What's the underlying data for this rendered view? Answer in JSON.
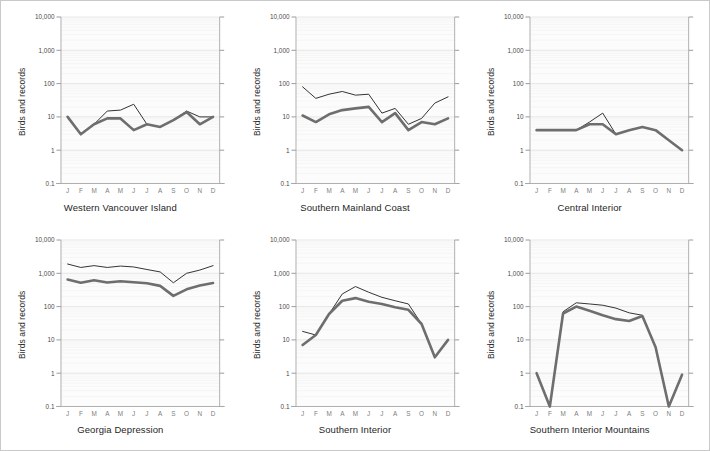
{
  "figure": {
    "axis_label_y": "Birds and records",
    "months": [
      "J",
      "F",
      "M",
      "A",
      "M",
      "J",
      "J",
      "A",
      "S",
      "O",
      "N",
      "D"
    ],
    "y_tick_labels": [
      "10,000",
      "1,000",
      "100",
      "10",
      "1",
      "0.1"
    ],
    "colors": {
      "series_records": "#333333",
      "series_birds": "#6e6e6e",
      "plot_background": "#fcfcfc",
      "major_gridline": "#dcdcdc",
      "minor_gridline": "#f0f0f0",
      "axis": "#a8a8a8",
      "frame": "#c9c9c9"
    }
  },
  "chart_data": [
    {
      "type": "line",
      "title": "Western Vancouver Island",
      "xlabel": "",
      "ylabel": "Birds and records",
      "yscale": "log",
      "ylim": [
        0.1,
        10000
      ],
      "ytick_values": [
        10000,
        1000,
        100,
        10,
        1,
        0.1
      ],
      "grid": true,
      "legend_position": "none",
      "categories": [
        "J",
        "F",
        "M",
        "A",
        "M",
        "J",
        "J",
        "A",
        "S",
        "O",
        "N",
        "D"
      ],
      "series": [
        {
          "name": "records",
          "values": [
            10,
            3,
            6,
            15,
            16,
            24,
            6,
            5,
            8,
            15,
            10,
            10
          ]
        },
        {
          "name": "birds",
          "values": [
            10,
            3,
            6,
            9,
            9,
            4,
            6,
            5,
            8,
            14,
            6,
            10
          ]
        }
      ]
    },
    {
      "type": "line",
      "title": "Southern Mainland Coast",
      "xlabel": "",
      "ylabel": "Birds and records",
      "yscale": "log",
      "ylim": [
        0.1,
        10000
      ],
      "ytick_values": [
        10000,
        1000,
        100,
        10,
        1,
        0.1
      ],
      "grid": true,
      "legend_position": "none",
      "categories": [
        "J",
        "F",
        "M",
        "A",
        "M",
        "J",
        "J",
        "A",
        "S",
        "O",
        "N",
        "D"
      ],
      "series": [
        {
          "name": "records",
          "values": [
            80,
            36,
            48,
            58,
            45,
            48,
            13,
            18,
            6,
            9,
            26,
            40
          ]
        },
        {
          "name": "birds",
          "values": [
            11,
            7,
            12,
            16,
            18,
            20,
            7,
            13,
            4,
            7,
            6,
            9
          ]
        }
      ]
    },
    {
      "type": "line",
      "title": "Central Interior",
      "xlabel": "",
      "ylabel": "Birds and records",
      "yscale": "log",
      "ylim": [
        0.1,
        10000
      ],
      "ytick_values": [
        10000,
        1000,
        100,
        10,
        1,
        0.1
      ],
      "grid": true,
      "legend_position": "none",
      "categories": [
        "J",
        "F",
        "M",
        "A",
        "M",
        "J",
        "J",
        "A",
        "S",
        "O",
        "N",
        "D"
      ],
      "series": [
        {
          "name": "records",
          "values": [
            4,
            4,
            4,
            4,
            7,
            13,
            3,
            4,
            5,
            4,
            2,
            1
          ]
        },
        {
          "name": "birds",
          "values": [
            4,
            4,
            4,
            4,
            6,
            6,
            3,
            4,
            5,
            4,
            2,
            1
          ]
        }
      ]
    },
    {
      "type": "line",
      "title": "Georgia Depression",
      "xlabel": "",
      "ylabel": "Birds and records",
      "yscale": "log",
      "ylim": [
        0.1,
        10000
      ],
      "ytick_values": [
        10000,
        1000,
        100,
        10,
        1,
        0.1
      ],
      "grid": true,
      "legend_position": "none",
      "categories": [
        "J",
        "F",
        "M",
        "A",
        "M",
        "J",
        "J",
        "A",
        "S",
        "O",
        "N",
        "D"
      ],
      "series": [
        {
          "name": "records",
          "values": [
            1900,
            1500,
            1700,
            1500,
            1650,
            1550,
            1300,
            1100,
            520,
            1000,
            1250,
            1700
          ]
        },
        {
          "name": "birds",
          "values": [
            650,
            520,
            620,
            530,
            580,
            540,
            500,
            420,
            210,
            330,
            430,
            510
          ]
        }
      ]
    },
    {
      "type": "line",
      "title": "Southern Interior",
      "xlabel": "",
      "ylabel": "Birds and records",
      "yscale": "log",
      "ylim": [
        0.1,
        10000
      ],
      "ytick_values": [
        10000,
        1000,
        100,
        10,
        1,
        0.1
      ],
      "grid": true,
      "legend_position": "none",
      "categories": [
        "J",
        "F",
        "M",
        "A",
        "M",
        "J",
        "J",
        "A",
        "S",
        "O",
        "N",
        "D"
      ],
      "series": [
        {
          "name": "records",
          "values": [
            18,
            14,
            60,
            240,
            400,
            270,
            190,
            150,
            120,
            30,
            3,
            10
          ]
        },
        {
          "name": "birds",
          "values": [
            7,
            14,
            60,
            150,
            180,
            140,
            120,
            95,
            80,
            30,
            3,
            10
          ]
        }
      ]
    },
    {
      "type": "line",
      "title": "Southern Interior Mountains",
      "xlabel": "",
      "ylabel": "Birds and records",
      "yscale": "log",
      "ylim": [
        0.1,
        10000
      ],
      "ytick_values": [
        10000,
        1000,
        100,
        10,
        1,
        0.1
      ],
      "grid": true,
      "legend_position": "none",
      "categories": [
        "J",
        "F",
        "M",
        "A",
        "M",
        "J",
        "J",
        "A",
        "S",
        "O",
        "N",
        "D"
      ],
      "series": [
        {
          "name": "records",
          "values": [
            1,
            0.1,
            70,
            130,
            120,
            110,
            90,
            65,
            55,
            6,
            0.1,
            0.9
          ]
        },
        {
          "name": "birds",
          "values": [
            1,
            0.1,
            62,
            100,
            75,
            55,
            42,
            37,
            52,
            6,
            0.1,
            0.9
          ]
        }
      ]
    }
  ]
}
